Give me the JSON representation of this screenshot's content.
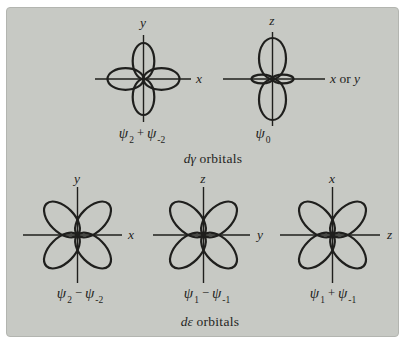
{
  "colors": {
    "page_bg": "#ffffff",
    "panel_bg": "#c7c9c4",
    "panel_border": "#b3b5b0",
    "ink": "#1f1f1d"
  },
  "figure": {
    "captions": {
      "d_gamma": {
        "lead": "dγ",
        "rest": " orbitals"
      },
      "d_epsilon": {
        "lead": "dε",
        "rest": " orbitals"
      }
    },
    "diagrams": [
      {
        "name": "d-x2-y2",
        "kind": "clover-axis",
        "v_label": "y",
        "h_label": {
          "pre": "x",
          "mid": "",
          "post": ""
        },
        "formula": {
          "base": "ψ",
          "sub": "2",
          "op": "+",
          "base2": "ψ",
          "sub2": "-2"
        }
      },
      {
        "name": "d-z2",
        "kind": "clover-vertical-with-ring",
        "v_label": "z",
        "h_label": {
          "pre": "x",
          "mid": " or ",
          "post": "y"
        },
        "formula": {
          "base": "ψ",
          "sub": "0"
        }
      },
      {
        "name": "d-xy",
        "kind": "clover-diagonal",
        "v_label": "y",
        "h_label": {
          "pre": "x",
          "mid": "",
          "post": ""
        },
        "formula": {
          "base": "ψ",
          "sub": "2",
          "op": "−",
          "base2": "ψ",
          "sub2": "-2"
        }
      },
      {
        "name": "d-yz",
        "kind": "clover-diagonal",
        "v_label": "z",
        "h_label": {
          "pre": "y",
          "mid": "",
          "post": ""
        },
        "formula": {
          "base": "ψ",
          "sub": "1",
          "op": "−",
          "base2": "ψ",
          "sub2": "-1"
        }
      },
      {
        "name": "d-zx",
        "kind": "clover-diagonal",
        "v_label": "x",
        "h_label": {
          "pre": "z",
          "mid": "",
          "post": ""
        },
        "formula": {
          "base": "ψ",
          "sub": "1",
          "op": "+",
          "base2": "ψ",
          "sub2": "-1"
        }
      }
    ]
  }
}
